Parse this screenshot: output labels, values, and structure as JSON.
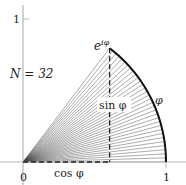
{
  "diagram": {
    "origin_label": "0",
    "x_tick_label": "1",
    "y_tick_label": "1",
    "n_label": "N = 32",
    "n": 32,
    "apex_label": "e^{iφ}",
    "apex_label_base": "e",
    "apex_label_sup": "iφ",
    "sin_label": "sin φ",
    "cos_label": "cos φ",
    "arc_label": "φ",
    "phi_radians": 0.92
  },
  "colors": {
    "axis": "#b0b0b0",
    "rays": "#333333",
    "arc": "#111111",
    "dashed": "#222222"
  }
}
